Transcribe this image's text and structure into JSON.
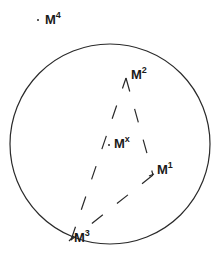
{
  "diagram": {
    "colors": {
      "stroke": "#2a2a2a",
      "text": "#1a1a1a",
      "background": "#ffffff"
    },
    "circle": {
      "cx": 110,
      "cy": 144,
      "r": 100
    },
    "points": [
      {
        "id": "M4",
        "base": "M",
        "sup": "4",
        "x": 38,
        "y": 20,
        "label_x": 45,
        "label_y": 11
      },
      {
        "id": "M2",
        "base": "M",
        "sup": "2",
        "x": 126,
        "y": 78,
        "label_x": 131,
        "label_y": 66
      },
      {
        "id": "Mx",
        "base": "M",
        "sup": "x",
        "x": 109,
        "y": 145,
        "label_x": 114,
        "label_y": 135
      },
      {
        "id": "M1",
        "base": "M",
        "sup": "1",
        "x": 153,
        "y": 175,
        "label_x": 157,
        "label_y": 161
      },
      {
        "id": "M3",
        "base": "M",
        "sup": "3",
        "x": 71,
        "y": 240,
        "label_x": 74,
        "label_y": 229
      }
    ],
    "dashed_edges": [
      {
        "from": "M2",
        "to": "M1"
      },
      {
        "from": "M1",
        "to": "M3"
      },
      {
        "from": "M3",
        "to": "M2"
      }
    ]
  }
}
